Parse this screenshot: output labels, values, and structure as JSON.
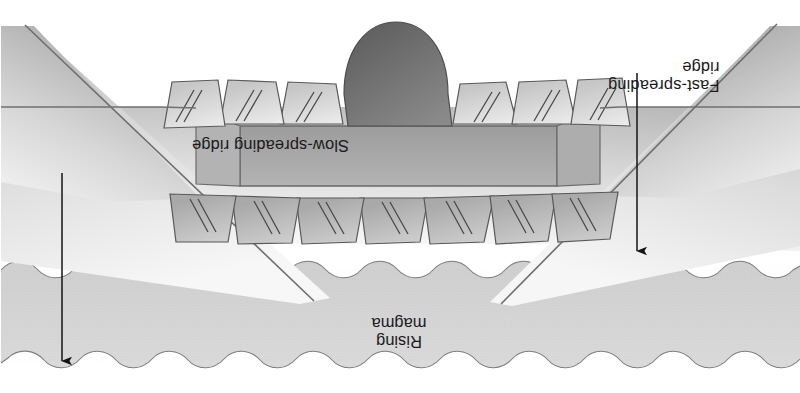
{
  "figure": {
    "orientation_degrees": 180,
    "labels": {
      "slow_spreading_ridge": "Slow-spreading ridge",
      "fast_spreading_ridge_line1": "Fast-spreading",
      "fast_spreading_ridge_line2": "ridge",
      "rising_magma_line1": "Rising",
      "rising_magma_line2": "magma"
    },
    "annotations": {
      "slow_arrow": "slow-spreading-ridge-pointer",
      "fast_arrow": "fast-spreading-ridge-pointer"
    },
    "colors": {
      "background": "#ffffff",
      "seafloor_band": "#d6d6d6",
      "ridge_flank_light": "#e8e8e8",
      "ridge_flank_mid": "#c0c0c0",
      "ridge_flank_dark": "#9a9a9a",
      "fault_block_face": "#cfcfcf",
      "magma_chamber": "#757575",
      "outline": "#5a5a5a",
      "arrow": "#1b1b1b",
      "text": "#1b1b1b"
    }
  }
}
